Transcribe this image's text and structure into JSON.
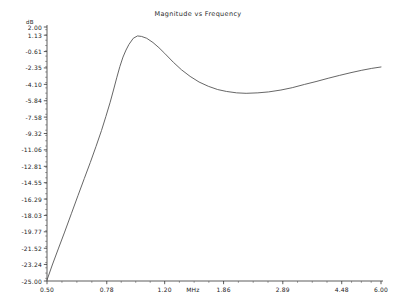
{
  "chart_data": {
    "type": "line",
    "title": "Magnitude vs Frequency",
    "xlabel": "MHz",
    "ylabel": "dB",
    "xscale": "log",
    "xlim": [
      0.5,
      6.0
    ],
    "ylim": [
      -25.0,
      2.0
    ],
    "grid": false,
    "legend": null,
    "xticks": [
      {
        "value": 0.5,
        "label": "0.50"
      },
      {
        "value": 0.78,
        "label": "0.78"
      },
      {
        "value": 1.2,
        "label": "1.20"
      },
      {
        "value": 1.86,
        "label": "1.86"
      },
      {
        "value": 2.89,
        "label": "2.89"
      },
      {
        "value": 4.48,
        "label": "4.48"
      },
      {
        "value": 6.0,
        "label": "6.00"
      }
    ],
    "yticks": [
      {
        "value": 2.0,
        "label": "2.00"
      },
      {
        "value": 1.13,
        "label": "1.13"
      },
      {
        "value": -0.61,
        "label": "-0.61"
      },
      {
        "value": -2.35,
        "label": "-2.35"
      },
      {
        "value": -4.1,
        "label": "-4.10"
      },
      {
        "value": -5.84,
        "label": "-5.84"
      },
      {
        "value": -7.58,
        "label": "-7.58"
      },
      {
        "value": -9.32,
        "label": "-9.32"
      },
      {
        "value": -11.06,
        "label": "-11.06"
      },
      {
        "value": -12.81,
        "label": "-12.81"
      },
      {
        "value": -14.55,
        "label": "-14.55"
      },
      {
        "value": -16.29,
        "label": "-16.29"
      },
      {
        "value": -18.03,
        "label": "-18.03"
      },
      {
        "value": -19.77,
        "label": "-19.77"
      },
      {
        "value": -21.52,
        "label": "-21.52"
      },
      {
        "value": -23.24,
        "label": "-23.24"
      },
      {
        "value": -25.0,
        "label": "-25.00"
      }
    ],
    "series": [
      {
        "name": "Magnitude",
        "color": "#555555",
        "x": [
          0.5,
          0.52,
          0.545,
          0.57,
          0.6,
          0.63,
          0.66,
          0.69,
          0.72,
          0.75,
          0.775,
          0.8,
          0.82,
          0.84,
          0.86,
          0.88,
          0.9,
          0.92,
          0.95,
          0.98,
          1.01,
          1.05,
          1.1,
          1.15,
          1.2,
          1.28,
          1.36,
          1.45,
          1.55,
          1.66,
          1.78,
          1.9,
          2.05,
          2.2,
          2.4,
          2.6,
          2.85,
          3.1,
          3.4,
          3.7,
          4.05,
          4.4,
          4.8,
          5.2,
          5.6,
          6.0
        ],
        "y": [
          -24.9,
          -23.3,
          -21.5,
          -19.8,
          -17.8,
          -15.9,
          -14.1,
          -12.4,
          -10.7,
          -9.0,
          -7.5,
          -6.0,
          -4.7,
          -3.4,
          -2.2,
          -1.2,
          -0.45,
          0.15,
          0.8,
          1.05,
          1.0,
          0.8,
          0.35,
          -0.2,
          -0.8,
          -1.75,
          -2.55,
          -3.25,
          -3.85,
          -4.3,
          -4.65,
          -4.85,
          -5.0,
          -5.05,
          -5.0,
          -4.9,
          -4.7,
          -4.45,
          -4.1,
          -3.8,
          -3.45,
          -3.15,
          -2.85,
          -2.6,
          -2.4,
          -2.25
        ]
      }
    ]
  }
}
